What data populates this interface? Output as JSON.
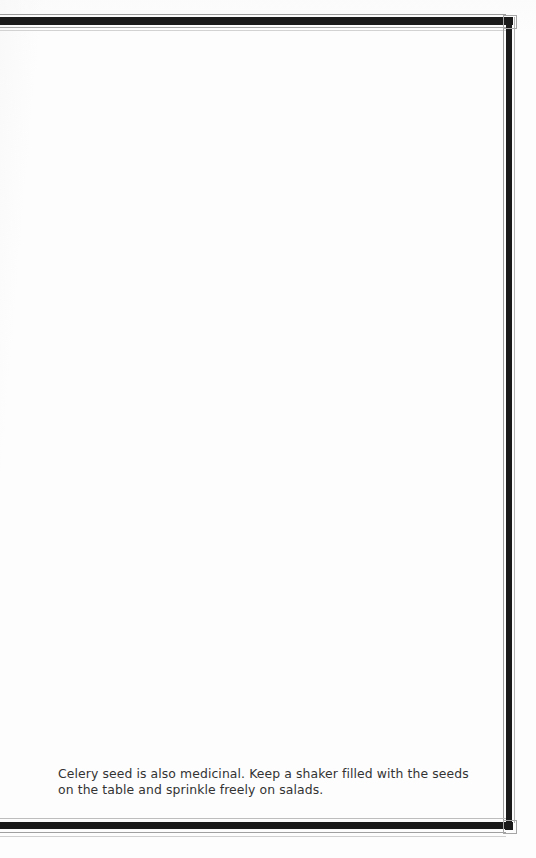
{
  "page": {
    "kind": "scanned-book-page",
    "background_color": "#fdfdfd",
    "ink_color": "#1a1a1a",
    "text_color": "#333333",
    "width": 536,
    "height": 858
  },
  "frame": {
    "style": "double-rule-border",
    "top_rule_color": "#1a1a1a",
    "right_rule_color": "#1a1a1a",
    "bottom_rule_color": "#1a1a1a",
    "hairline_color": "#9b9b9b",
    "corner_mark_color": "#1a1a1a",
    "left_edge": "cropped-at-gutter"
  },
  "content": {
    "paragraph": "Celery seed is also medicinal. Keep a shaker filled with the seeds on the table and sprinkle freely on salads."
  }
}
